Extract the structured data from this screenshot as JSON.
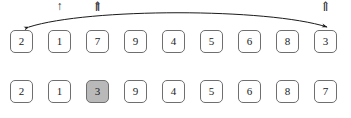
{
  "figure": {
    "name": "array-swap-illustration",
    "colors": {
      "cell_border": "#6f6f6f",
      "cell_fill": "#ffffff",
      "highlight_fill": "#b9b9b9",
      "text": "#1a1a1a",
      "arrow": "#1a1a1a"
    },
    "layout": {
      "cell_count": 9,
      "cell_width": 23,
      "cell_pitch": 38,
      "first_cell_x": 10
    }
  },
  "swap_arc": {
    "label": "swap-arrow",
    "from_index": 2,
    "to_index": 8,
    "double_headed": true,
    "from_x": 29,
    "to_x": 327,
    "apex_y": 8,
    "end_y": 28
  },
  "rows": [
    {
      "name": "array-row-before",
      "values": [
        "2",
        "1",
        "7",
        "9",
        "4",
        "5",
        "6",
        "8",
        "3"
      ],
      "highlight_index": -1,
      "markers": [
        {
          "index": 1,
          "glyph": "↑",
          "kind": "single",
          "name": "pointer-i"
        },
        {
          "index": 2,
          "glyph": "↑",
          "kind": "single",
          "name": "pointer-j"
        },
        {
          "index": 8,
          "glyph": "⇑",
          "kind": "double",
          "name": "pointer-pivot"
        }
      ]
    },
    {
      "name": "array-row-after",
      "values": [
        "2",
        "1",
        "3",
        "9",
        "4",
        "5",
        "6",
        "8",
        "7"
      ],
      "highlight_index": 2,
      "markers": [
        {
          "index": 2,
          "glyph": "⇑",
          "kind": "double",
          "name": "pointer-pivot-final"
        }
      ]
    }
  ]
}
